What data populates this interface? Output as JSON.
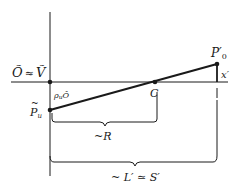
{
  "diagram": {
    "type": "geometric-optics-sketch",
    "labels": {
      "origin": "Õ ≈ Ṽ",
      "origin_left": "Õ",
      "origin_approx": "≈",
      "origin_right": "Ṽ",
      "angle": "ρ",
      "angle_sub": "u",
      "angle_vertex": "Ô",
      "point_pu": "P",
      "point_pu_sub": "u",
      "point_c": "C",
      "point_p0": "P′",
      "point_p0_sub": "0",
      "offset": "x′",
      "brace_r": "~R",
      "brace_l": "~ L′ ≃ S′"
    },
    "colors": {
      "ink": "#1a1a1a",
      "background": "#ffffff"
    }
  }
}
